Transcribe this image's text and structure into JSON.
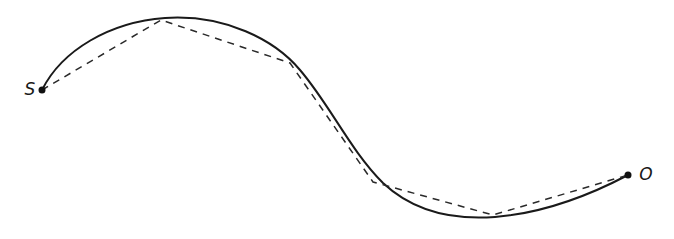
{
  "diagram": {
    "type": "curve-with-polygonal-approximation",
    "colors": {
      "background": "#ffffff",
      "curve": "#1a1a1a",
      "chord": "#2a2a2a",
      "endpoint": "#111111"
    },
    "start": {
      "label": "S",
      "x": 42,
      "y": 90
    },
    "end": {
      "label": "O",
      "x": 628,
      "y": 175
    },
    "polyline_vertices": [
      {
        "x": 42,
        "y": 90
      },
      {
        "x": 161,
        "y": 20
      },
      {
        "x": 290,
        "y": 63
      },
      {
        "x": 373,
        "y": 182
      },
      {
        "x": 493,
        "y": 215
      },
      {
        "x": 628,
        "y": 175
      }
    ]
  }
}
